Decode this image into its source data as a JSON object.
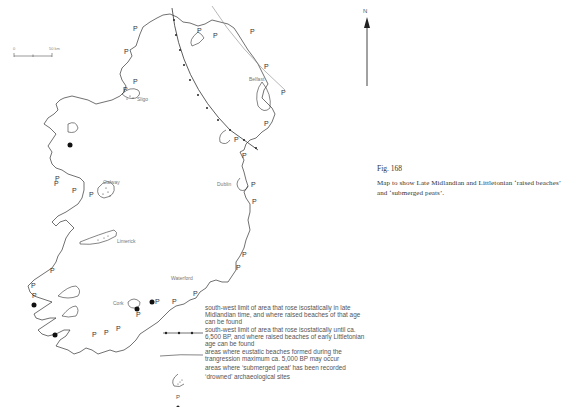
{
  "figure": {
    "number": "Fig. 168",
    "caption": "Map to show Late Midlandian and Littletonian ‘raised beaches’ and ‘submerged peats’."
  },
  "map": {
    "north_label": "N",
    "scale": {
      "start": "0",
      "end": "50 km"
    },
    "places": [
      {
        "name": "Belfast"
      },
      {
        "name": "Sligo"
      },
      {
        "name": "Galway"
      },
      {
        "name": "Dublin"
      },
      {
        "name": "Limerick"
      },
      {
        "name": "Waterford"
      },
      {
        "name": "Cork"
      }
    ],
    "peat_marker": "P",
    "colors": {
      "line": "#333333",
      "light_line": "#888888",
      "background": "#ffffff"
    }
  },
  "legend": {
    "items": [
      {
        "symbol": "line-with-dots",
        "text": "south-west limit of area that rose isostatically in late Midlandian time, and where raised beaches of that age can be found"
      },
      {
        "symbol": "plain-line",
        "text": "south-west limit of area that rose isostatically until ca. 6,500 BP, and where raised beaches of early Littletonian age can be found"
      },
      {
        "symbol": "stippled-area",
        "text": "areas where eustatic beaches formed during the trangression maximum ca. 5,000 BP may occur"
      },
      {
        "symbol": "P",
        "text": "areas where ‘submerged peat’ has been recorded"
      },
      {
        "symbol": "filled-dot",
        "text": "‘drowned’ archaeological sites"
      }
    ]
  }
}
